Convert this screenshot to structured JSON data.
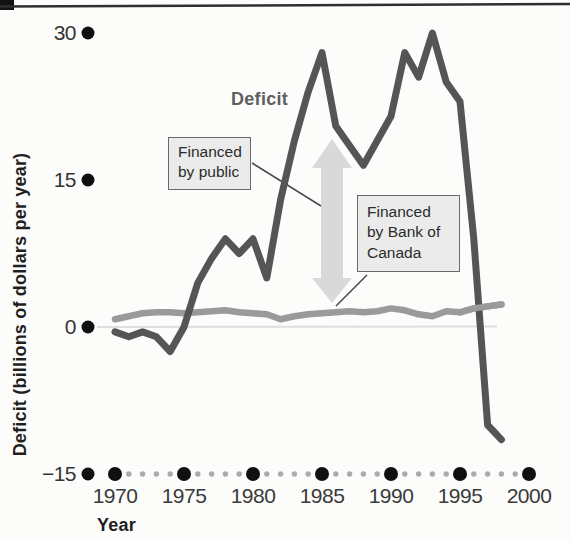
{
  "figure_kind": "scanned textbook chart of Canadian federal deficit and its financing",
  "axes": {
    "y": {
      "title": "Deficit (billions of dollars per year)",
      "ticks": [
        "30",
        "15",
        "0",
        "−15"
      ],
      "tick_values": [
        30,
        15,
        0,
        -15
      ]
    },
    "x": {
      "title": "Year",
      "ticks": [
        "1970",
        "1975",
        "1980",
        "1985",
        "1990",
        "1995",
        "2000"
      ],
      "tick_values": [
        1970,
        1975,
        1980,
        1985,
        1990,
        1995,
        2000
      ]
    }
  },
  "curve_label": "Deficit",
  "callouts": {
    "financed_by_public": {
      "line1": "Financed",
      "line2": "by public"
    },
    "financed_by_bank_of_canada": {
      "line1": "Financed",
      "line2": "by Bank of",
      "line3": "Canada"
    }
  },
  "colors": {
    "deficit_line": "#555555",
    "bank_of_canada_line": "#9a9a9a",
    "gap_arrow": "#d9d9d9",
    "zero_line": "#dedede",
    "callout_fill": "#ebebeb",
    "axis_dot": "#101010",
    "minor_dot": "#ababab",
    "top_rule": "#2e2e2e"
  },
  "chart_data": {
    "type": "line",
    "title": "",
    "xlabel": "Year",
    "ylabel": "Deficit (billions of dollars per year)",
    "xlim": [
      1969,
      2000
    ],
    "ylim": [
      -15,
      30
    ],
    "grid": false,
    "legend": "none (callout boxes with leader lines instead)",
    "x": [
      1970,
      1971,
      1972,
      1973,
      1974,
      1975,
      1976,
      1977,
      1978,
      1979,
      1980,
      1981,
      1982,
      1983,
      1984,
      1985,
      1986,
      1987,
      1988,
      1989,
      1990,
      1991,
      1992,
      1993,
      1994,
      1995,
      1996,
      1997,
      1998
    ],
    "series": [
      {
        "name": "Deficit",
        "color": "#555555",
        "values": [
          -0.5,
          -1,
          -0.5,
          -1,
          -2.5,
          0,
          4.5,
          7,
          9,
          7.5,
          9,
          5,
          13,
          19,
          24,
          28,
          20.5,
          18.5,
          16.5,
          19,
          21.5,
          28,
          25.5,
          30,
          25,
          23,
          9,
          -10,
          -11.5
        ]
      },
      {
        "name": "Financed by Bank of Canada",
        "color": "#9a9a9a",
        "values": [
          0.8,
          1.1,
          1.4,
          1.5,
          1.5,
          1.4,
          1.5,
          1.6,
          1.7,
          1.5,
          1.4,
          1.3,
          0.8,
          1.1,
          1.3,
          1.4,
          1.5,
          1.6,
          1.5,
          1.6,
          1.9,
          1.7,
          1.3,
          1.1,
          1.6,
          1.5,
          1.9,
          2.1,
          2.3
        ]
      }
    ],
    "annotations": [
      "Deficit (bold label on the dark curve)",
      "Financed by public (boxed label, leader line to gray vertical gap arrow)",
      "Financed by Bank of Canada (boxed label, leader line to flat gray line near zero)",
      "light-gray double-headed vertical arrow around 1985-86 marking the gap between the deficit curve and the Bank-of-Canada-financed line"
    ]
  }
}
